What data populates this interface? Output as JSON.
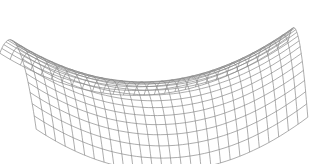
{
  "figure": {
    "type": "wireframe-surface",
    "surface": "saddle (hyperbolic paraboloid)",
    "width": 313,
    "height": 164,
    "background": "#ffffff",
    "line_color": "#8a8a8a",
    "line_width": 0.7,
    "grid": {
      "u_lines": 28,
      "v_lines": 18
    },
    "domain": {
      "u": [
        -1,
        1
      ],
      "v": [
        -1,
        1
      ]
    },
    "projection": {
      "center_x": 158,
      "center_y": 80,
      "scale_x": 140,
      "scale_y": 38,
      "skew": 0.35,
      "height_scale": 48
    }
  }
}
